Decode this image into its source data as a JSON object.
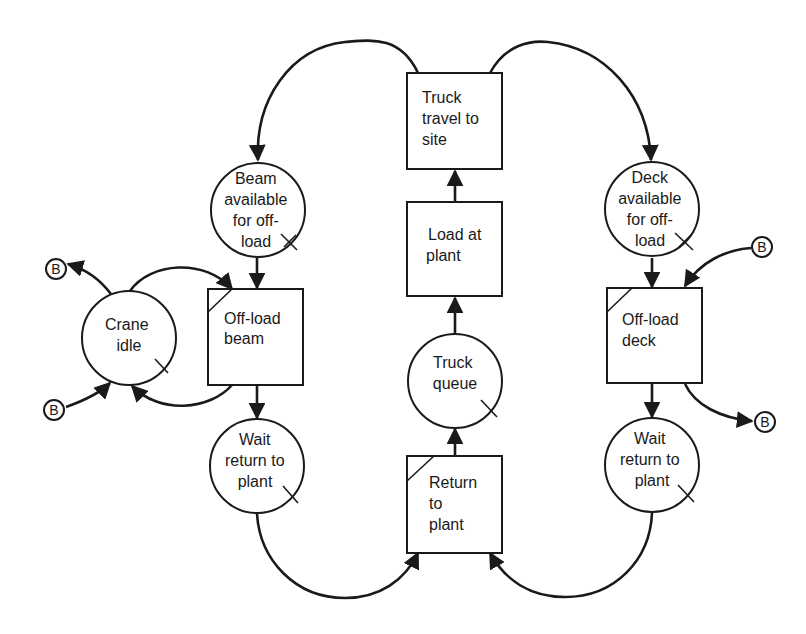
{
  "diagram": {
    "type": "activity cycle diagram",
    "nodes": {
      "beam_available": {
        "shape": "queue-circle",
        "lines": [
          "Beam",
          "available",
          "for off-",
          "load"
        ]
      },
      "offload_beam": {
        "shape": "activity-box",
        "lines": [
          "Off-load",
          "beam"
        ]
      },
      "crane_idle": {
        "shape": "queue-circle",
        "lines": [
          "Crane",
          "idle"
        ]
      },
      "wait_return_left": {
        "shape": "queue-circle",
        "lines": [
          "Wait",
          "return to",
          "plant"
        ]
      },
      "truck_travel": {
        "shape": "activity-box",
        "lines": [
          "Truck",
          "travel to",
          "site"
        ]
      },
      "load_at_plant": {
        "shape": "activity-box",
        "lines": [
          "Load at",
          "plant"
        ]
      },
      "truck_queue": {
        "shape": "queue-circle",
        "lines": [
          "Truck",
          "queue"
        ]
      },
      "return_to_plant": {
        "shape": "activity-box",
        "lines": [
          "Return",
          "to",
          "plant"
        ]
      },
      "deck_available": {
        "shape": "queue-circle",
        "lines": [
          "Deck",
          "available",
          "for off-",
          "load"
        ]
      },
      "offload_deck": {
        "shape": "activity-box",
        "lines": [
          "Off-load",
          "deck"
        ]
      },
      "wait_return_right": {
        "shape": "queue-circle",
        "lines": [
          "Wait",
          "return to",
          "plant"
        ]
      }
    },
    "connectors": {
      "b_left_top": "B",
      "b_left_bottom": "B",
      "b_right_top": "B",
      "b_right_bottom": "B"
    },
    "edges": [
      {
        "from": "truck_travel",
        "to": "beam_available"
      },
      {
        "from": "truck_travel",
        "to": "deck_available"
      },
      {
        "from": "load_at_plant",
        "to": "truck_travel"
      },
      {
        "from": "truck_queue",
        "to": "load_at_plant"
      },
      {
        "from": "return_to_plant",
        "to": "truck_queue"
      },
      {
        "from": "beam_available",
        "to": "offload_beam"
      },
      {
        "from": "crane_idle",
        "to": "offload_beam"
      },
      {
        "from": "offload_beam",
        "to": "crane_idle"
      },
      {
        "from": "offload_beam",
        "to": "wait_return_left"
      },
      {
        "from": "crane_idle",
        "to": "b_left_top"
      },
      {
        "from": "b_left_bottom",
        "to": "crane_idle"
      },
      {
        "from": "deck_available",
        "to": "offload_deck"
      },
      {
        "from": "b_right_top",
        "to": "offload_deck"
      },
      {
        "from": "offload_deck",
        "to": "b_right_bottom"
      },
      {
        "from": "offload_deck",
        "to": "wait_return_right"
      },
      {
        "from": "wait_return_left",
        "to": "return_to_plant"
      },
      {
        "from": "wait_return_right",
        "to": "return_to_plant"
      }
    ],
    "colors": {
      "ink": "#1a1a1a",
      "background": "#ffffff"
    }
  }
}
